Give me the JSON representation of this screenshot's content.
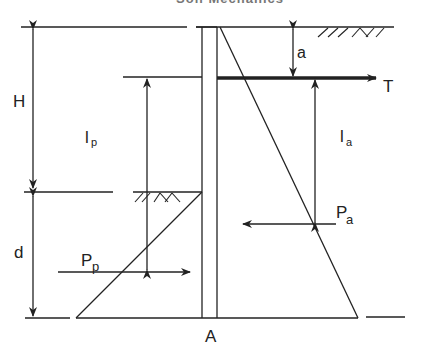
{
  "title_clipped": "Soil Mechanics",
  "labels": {
    "H": "H",
    "d": "d",
    "a": "a",
    "T": "T",
    "lp_main": "l",
    "lp_sub": "p",
    "la_main": "l",
    "la_sub": "a",
    "Pp_main": "P",
    "Pp_sub": "p",
    "Pa_main": "P",
    "Pa_sub": "a",
    "A": "A"
  },
  "colors": {
    "line": "#222222",
    "background": "#ffffff"
  }
}
